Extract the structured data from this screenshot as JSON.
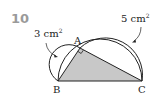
{
  "problem": {
    "number": "10"
  },
  "labels": {
    "area_small_value": "3 cm",
    "area_small_exp": "2",
    "area_large_value": "5 cm",
    "area_large_exp": "2",
    "vertex_a": "A",
    "vertex_b": "B",
    "vertex_c": "C"
  },
  "colors": {
    "stroke": "#222222",
    "triangle_fill": "#c8c8c8",
    "number": "#9a9a9a"
  },
  "geometry": {
    "A": [
      80,
      48
    ],
    "B": [
      58,
      81
    ],
    "C": [
      142,
      81
    ],
    "right_angle_at": "A"
  }
}
